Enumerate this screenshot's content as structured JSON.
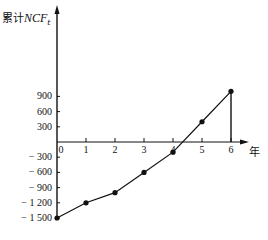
{
  "chart_data": {
    "type": "line",
    "title": "",
    "xlabel": "年",
    "ylabel": "累计NCF_t",
    "ylabel_parts": {
      "prefix": "累计",
      "var": "NCF",
      "sub": "t"
    },
    "x": [
      0,
      1,
      2,
      3,
      4,
      5,
      6
    ],
    "x_tick_labels": [
      "0",
      "1",
      "2",
      "3",
      "4",
      "5",
      "6"
    ],
    "y_tick_values": [
      900,
      600,
      300,
      -300,
      -600,
      -900,
      -1200,
      -1500
    ],
    "y_tick_labels": [
      "900",
      "600",
      "300",
      "− 300",
      "− 600",
      "− 900",
      "− 1 200",
      "− 1 500"
    ],
    "series": [
      {
        "name": "累计NCF",
        "values": [
          -1500,
          -1200,
          -1000,
          -600,
          -200,
          400,
          1000
        ]
      }
    ],
    "ylim": [
      -1500,
      1800
    ],
    "xlim": [
      0,
      7
    ],
    "grid": false,
    "legend": null,
    "annotations": [
      {
        "type": "vertical-drop-line",
        "x": 6,
        "from": 0,
        "to": 1000
      }
    ]
  }
}
